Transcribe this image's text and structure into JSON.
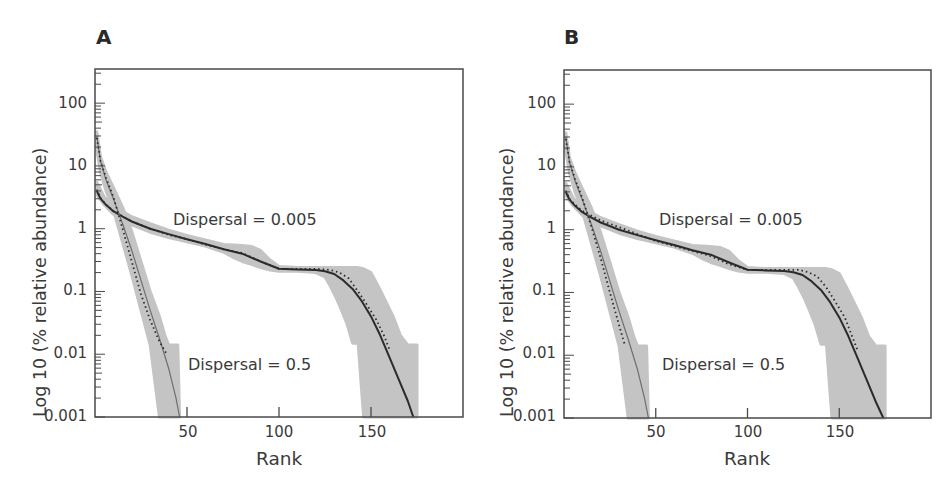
{
  "chart_data": [
    {
      "panel": "A",
      "type": "line",
      "title": "A",
      "xlabel": "Rank",
      "ylabel": "Log 10 (% relative abundance)",
      "yscale": "log",
      "xlim": [
        0,
        200
      ],
      "ylim": [
        0.001,
        350
      ],
      "xticks": [
        50,
        100,
        150
      ],
      "xtick_labels": [
        "50",
        "100",
        "150"
      ],
      "yticks": [
        100,
        10,
        1,
        0.1,
        0.01,
        0.001
      ],
      "ytick_labels": [
        "100",
        "10",
        "1",
        "0.1",
        "0.01",
        "0.001"
      ],
      "grid": false,
      "annotations": [
        {
          "text": "Dispersal = 0.005",
          "x": 42,
          "y": 1.3
        },
        {
          "text": "Dispersal = 0.5",
          "x": 44,
          "y": 0.005
        }
      ],
      "series": [
        {
          "name": "Dispersal = 0.005 (mean)",
          "style": "solid",
          "x": [
            1,
            3,
            6,
            10,
            15,
            20,
            30,
            40,
            50,
            60,
            70,
            80,
            90,
            100,
            110,
            120,
            125,
            130,
            135,
            140,
            145,
            150,
            155,
            160,
            165,
            170,
            173
          ],
          "y": [
            4.0,
            3.0,
            2.4,
            1.9,
            1.55,
            1.3,
            1.0,
            0.82,
            0.68,
            0.57,
            0.47,
            0.4,
            0.3,
            0.23,
            0.225,
            0.22,
            0.21,
            0.19,
            0.15,
            0.11,
            0.07,
            0.04,
            0.02,
            0.009,
            0.004,
            0.0018,
            0.001
          ]
        },
        {
          "name": "Dispersal = 0.005 (observed)",
          "style": "dotted",
          "x": [
            1,
            3,
            6,
            10,
            20,
            30,
            40,
            50,
            60,
            70,
            80,
            90,
            100,
            110,
            120,
            128,
            133,
            138,
            143,
            148,
            153,
            157,
            160
          ],
          "y": [
            4.2,
            3.1,
            2.4,
            1.9,
            1.3,
            1.0,
            0.8,
            0.68,
            0.56,
            0.47,
            0.41,
            0.3,
            0.23,
            0.23,
            0.23,
            0.22,
            0.2,
            0.16,
            0.1,
            0.06,
            0.035,
            0.02,
            0.012
          ]
        },
        {
          "name": "Dispersal = 0.005 (envelope)",
          "style": "band",
          "x": [
            1,
            5,
            10,
            20,
            30,
            40,
            50,
            60,
            70,
            75,
            80,
            85,
            90,
            95,
            100,
            110,
            120,
            125,
            128,
            131,
            134,
            137,
            140,
            143,
            146,
            150,
            154,
            158,
            162,
            166,
            170,
            175,
            175
          ],
          "upper": [
            5.5,
            3.2,
            2.3,
            1.55,
            1.2,
            0.95,
            0.78,
            0.66,
            0.56,
            0.55,
            0.54,
            0.52,
            0.45,
            0.32,
            0.25,
            0.24,
            0.24,
            0.24,
            0.24,
            0.24,
            0.24,
            0.24,
            0.24,
            0.24,
            0.23,
            0.2,
            0.12,
            0.07,
            0.04,
            0.02,
            0.014,
            0.014,
            0.001
          ],
          "lower": [
            3.5,
            2.4,
            1.7,
            1.15,
            0.88,
            0.72,
            0.62,
            0.53,
            0.42,
            0.35,
            0.3,
            0.27,
            0.24,
            0.22,
            0.21,
            0.21,
            0.2,
            0.17,
            0.12,
            0.08,
            0.05,
            0.03,
            0.015,
            0.015,
            0.001,
            0.001,
            0.001,
            0.001,
            0.001,
            0.001,
            0.001,
            0.001,
            0.001
          ]
        },
        {
          "name": "Dispersal = 0.5 (mean)",
          "style": "solid-thin",
          "x": [
            1,
            3,
            6,
            10,
            15,
            20,
            25,
            30,
            35,
            40,
            44,
            46
          ],
          "y": [
            30,
            12,
            6,
            3.0,
            1.2,
            0.45,
            0.15,
            0.05,
            0.018,
            0.006,
            0.002,
            0.001
          ]
        },
        {
          "name": "Dispersal = 0.5 (observed)",
          "style": "dotted",
          "x": [
            1,
            3,
            6,
            10,
            15,
            20,
            25,
            30,
            35,
            39
          ],
          "y": [
            28,
            12,
            6.5,
            3.2,
            1.0,
            0.3,
            0.09,
            0.035,
            0.016,
            0.01
          ]
        },
        {
          "name": "Dispersal = 0.5 (envelope)",
          "style": "band",
          "x": [
            1,
            3,
            6,
            10,
            15,
            20,
            25,
            30,
            35,
            38,
            40,
            45,
            46
          ],
          "upper": [
            35,
            14,
            8,
            4.5,
            2.2,
            0.9,
            0.3,
            0.1,
            0.04,
            0.02,
            0.014,
            0.014,
            0.001
          ],
          "lower": [
            18,
            8,
            4,
            2.0,
            0.6,
            0.18,
            0.05,
            0.014,
            0.001,
            0.001,
            0.001,
            0.001,
            0.001
          ]
        }
      ]
    },
    {
      "panel": "B",
      "type": "line",
      "title": "B",
      "xlabel": "Rank",
      "ylabel": "Log 10 (% relative abundance)",
      "yscale": "log",
      "xlim": [
        0,
        200
      ],
      "ylim": [
        0.001,
        350
      ],
      "xticks": [
        50,
        100,
        150
      ],
      "xtick_labels": [
        "50",
        "100",
        "150"
      ],
      "yticks": [
        100,
        10,
        1,
        0.1,
        0.01,
        0.001
      ],
      "ytick_labels": [
        "100",
        "10",
        "1",
        "0.1",
        "0.01",
        "0.001"
      ],
      "grid": false,
      "annotations": [
        {
          "text": "Dispersal = 0.005",
          "x": 52,
          "y": 1.3
        },
        {
          "text": "Dispersal = 0.5",
          "x": 54,
          "y": 0.005
        }
      ],
      "series": [
        {
          "name": "Dispersal = 0.005 (mean)",
          "style": "solid",
          "x": [
            1,
            3,
            6,
            10,
            15,
            20,
            30,
            40,
            50,
            60,
            70,
            80,
            90,
            100,
            110,
            120,
            125,
            130,
            135,
            140,
            145,
            150,
            155,
            160,
            165,
            170,
            174
          ],
          "y": [
            4.0,
            3.0,
            2.4,
            1.9,
            1.55,
            1.3,
            1.0,
            0.82,
            0.68,
            0.57,
            0.47,
            0.4,
            0.3,
            0.23,
            0.225,
            0.22,
            0.21,
            0.19,
            0.15,
            0.11,
            0.07,
            0.04,
            0.02,
            0.009,
            0.004,
            0.0018,
            0.001
          ]
        },
        {
          "name": "Dispersal = 0.005 (observed)",
          "style": "dotted",
          "x": [
            1,
            3,
            6,
            10,
            20,
            30,
            40,
            50,
            60,
            70,
            80,
            90,
            100,
            110,
            120,
            128,
            133,
            138,
            143,
            148,
            153,
            157,
            160
          ],
          "y": [
            4.2,
            3.1,
            2.5,
            2.0,
            1.4,
            1.1,
            0.85,
            0.66,
            0.55,
            0.46,
            0.38,
            0.28,
            0.23,
            0.23,
            0.23,
            0.23,
            0.21,
            0.18,
            0.12,
            0.07,
            0.04,
            0.02,
            0.012
          ]
        },
        {
          "name": "Dispersal = 0.005 (envelope)",
          "style": "band",
          "x": [
            1,
            5,
            10,
            20,
            30,
            40,
            50,
            60,
            70,
            75,
            80,
            85,
            90,
            95,
            100,
            110,
            120,
            125,
            128,
            131,
            134,
            137,
            140,
            143,
            146,
            150,
            154,
            158,
            162,
            166,
            170,
            175,
            175
          ],
          "upper": [
            5.5,
            3.2,
            2.3,
            1.55,
            1.2,
            0.95,
            0.78,
            0.66,
            0.56,
            0.55,
            0.54,
            0.52,
            0.45,
            0.32,
            0.25,
            0.24,
            0.24,
            0.24,
            0.24,
            0.24,
            0.24,
            0.24,
            0.24,
            0.24,
            0.23,
            0.2,
            0.12,
            0.07,
            0.04,
            0.02,
            0.014,
            0.014,
            0.001
          ],
          "lower": [
            3.5,
            2.4,
            1.7,
            1.15,
            0.88,
            0.72,
            0.62,
            0.53,
            0.42,
            0.35,
            0.3,
            0.27,
            0.24,
            0.22,
            0.21,
            0.21,
            0.2,
            0.17,
            0.12,
            0.08,
            0.05,
            0.03,
            0.015,
            0.015,
            0.001,
            0.001,
            0.001,
            0.001,
            0.001,
            0.001,
            0.001,
            0.001,
            0.001
          ]
        },
        {
          "name": "Dispersal = 0.5 (mean)",
          "style": "solid-thin",
          "x": [
            1,
            3,
            6,
            10,
            15,
            20,
            25,
            30,
            35,
            40,
            44,
            46
          ],
          "y": [
            30,
            12,
            6,
            3.0,
            1.2,
            0.45,
            0.15,
            0.05,
            0.018,
            0.006,
            0.002,
            0.001
          ]
        },
        {
          "name": "Dispersal = 0.5 (observed)",
          "style": "dotted",
          "x": [
            1,
            3,
            6,
            10,
            15,
            20,
            25,
            30,
            33
          ],
          "y": [
            28,
            12,
            6.5,
            3.2,
            1.1,
            0.35,
            0.1,
            0.03,
            0.015
          ]
        },
        {
          "name": "Dispersal = 0.5 (envelope)",
          "style": "band",
          "x": [
            1,
            3,
            6,
            10,
            15,
            20,
            25,
            30,
            35,
            38,
            40,
            45,
            46
          ],
          "upper": [
            35,
            14,
            8,
            4.5,
            2.2,
            0.9,
            0.3,
            0.1,
            0.04,
            0.02,
            0.014,
            0.014,
            0.001
          ],
          "lower": [
            18,
            8,
            4,
            2.0,
            0.6,
            0.18,
            0.05,
            0.014,
            0.001,
            0.001,
            0.001,
            0.001,
            0.001
          ]
        }
      ]
    }
  ],
  "panels": [
    {
      "letter": "A",
      "xlabel": "Rank",
      "ylabel": "Log 10 (% relative abundance)",
      "xticks": [
        "50",
        "100",
        "150"
      ],
      "yticks": [
        "100",
        "10",
        "1",
        "0.1",
        "0.01",
        "0.001"
      ],
      "annot_high": "Dispersal = 0.005",
      "annot_low": "Dispersal = 0.5"
    },
    {
      "letter": "B",
      "xlabel": "Rank",
      "ylabel": "Log 10 (% relative abundance)",
      "xticks": [
        "50",
        "100",
        "150"
      ],
      "yticks": [
        "100",
        "10",
        "1",
        "0.1",
        "0.01",
        "0.001"
      ],
      "annot_high": "Dispersal = 0.005",
      "annot_low": "Dispersal = 0.5"
    }
  ],
  "colors": {
    "band": "#c4c4c4",
    "line": "#2b2b2b",
    "thin_line": "#6e6e6e",
    "axis": "#4a4a4a",
    "text": "#3a3a3a"
  }
}
